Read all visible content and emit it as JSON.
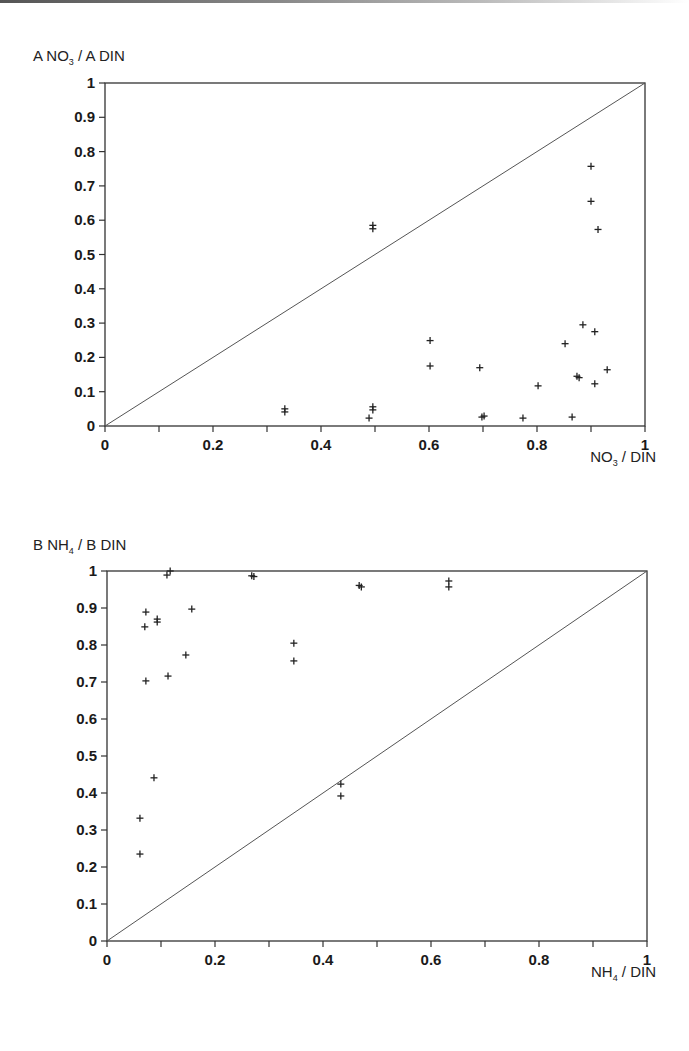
{
  "chart_data": [
    {
      "id": "A",
      "type": "scatter",
      "title": "",
      "ylabel": {
        "prefix": "A NO",
        "sub": "3",
        "suffix": " / A DIN"
      },
      "xlabel": {
        "prefix": "NO",
        "sub": "3",
        "suffix": " / DIN"
      },
      "xlim": [
        0,
        1
      ],
      "ylim": [
        0,
        1
      ],
      "x_ticks": [
        0,
        0.1,
        0.2,
        0.3,
        0.4,
        0.5,
        0.6,
        0.7,
        0.8,
        0.9,
        1
      ],
      "x_tick_labels": [
        "0",
        "",
        "0.2",
        "",
        "0.4",
        "",
        "0.6",
        "",
        "0.8",
        "",
        "1"
      ],
      "y_ticks": [
        0,
        0.1,
        0.2,
        0.3,
        0.4,
        0.5,
        0.6,
        0.7,
        0.8,
        0.9,
        1
      ],
      "y_tick_labels": [
        "0",
        "0.1",
        "0.2",
        "0.3",
        "0.4",
        "0.5",
        "0.6",
        "0.7",
        "0.8",
        "0.9",
        "1"
      ],
      "grid": false,
      "reference_line": {
        "label": "1:1 line",
        "from": [
          0,
          0
        ],
        "to": [
          1,
          1
        ]
      },
      "marker": "+",
      "points": [
        {
          "x": 0.333,
          "y": 0.05
        },
        {
          "x": 0.333,
          "y": 0.041
        },
        {
          "x": 0.489,
          "y": 0.023
        },
        {
          "x": 0.496,
          "y": 0.056
        },
        {
          "x": 0.496,
          "y": 0.047
        },
        {
          "x": 0.496,
          "y": 0.585
        },
        {
          "x": 0.496,
          "y": 0.575
        },
        {
          "x": 0.602,
          "y": 0.249
        },
        {
          "x": 0.602,
          "y": 0.175
        },
        {
          "x": 0.694,
          "y": 0.17
        },
        {
          "x": 0.698,
          "y": 0.026
        },
        {
          "x": 0.702,
          "y": 0.029
        },
        {
          "x": 0.774,
          "y": 0.023
        },
        {
          "x": 0.802,
          "y": 0.117
        },
        {
          "x": 0.852,
          "y": 0.24
        },
        {
          "x": 0.865,
          "y": 0.026
        },
        {
          "x": 0.874,
          "y": 0.145
        },
        {
          "x": 0.878,
          "y": 0.141
        },
        {
          "x": 0.885,
          "y": 0.295
        },
        {
          "x": 0.9,
          "y": 0.757
        },
        {
          "x": 0.9,
          "y": 0.655
        },
        {
          "x": 0.907,
          "y": 0.275
        },
        {
          "x": 0.907,
          "y": 0.123
        },
        {
          "x": 0.913,
          "y": 0.573
        },
        {
          "x": 0.93,
          "y": 0.164
        }
      ],
      "box": {
        "left": 105,
        "top": 83,
        "width": 540,
        "height": 343
      },
      "panel_top": 0,
      "ylabel_pos": {
        "left": 33,
        "top": 47
      },
      "xlabel_pos": {
        "right": 33,
        "top": 448
      }
    },
    {
      "id": "B",
      "type": "scatter",
      "title": "",
      "ylabel": {
        "prefix": "B NH",
        "sub": "4",
        "suffix": " / B DIN"
      },
      "xlabel": {
        "prefix": "NH",
        "sub": "4",
        "suffix": " / DIN"
      },
      "xlim": [
        0,
        1
      ],
      "ylim": [
        0,
        1
      ],
      "x_ticks": [
        0,
        0.1,
        0.2,
        0.3,
        0.4,
        0.5,
        0.6,
        0.7,
        0.8,
        0.9,
        1
      ],
      "x_tick_labels": [
        "0",
        "",
        "0.2",
        "",
        "0.4",
        "",
        "0.6",
        "",
        "0.8",
        "",
        "1"
      ],
      "y_ticks": [
        0,
        0.1,
        0.2,
        0.3,
        0.4,
        0.5,
        0.6,
        0.7,
        0.8,
        0.9,
        1
      ],
      "y_tick_labels": [
        "0",
        "0.1",
        "0.2",
        "0.3",
        "0.4",
        "0.5",
        "0.6",
        "0.7",
        "0.8",
        "0.9",
        "1"
      ],
      "grid": false,
      "reference_line": {
        "label": "1:1 line",
        "from": [
          0,
          0
        ],
        "to": [
          1,
          1
        ]
      },
      "marker": "+",
      "points": [
        {
          "x": 0.061,
          "y": 0.332
        },
        {
          "x": 0.061,
          "y": 0.235
        },
        {
          "x": 0.07,
          "y": 0.849
        },
        {
          "x": 0.072,
          "y": 0.889
        },
        {
          "x": 0.072,
          "y": 0.703
        },
        {
          "x": 0.087,
          "y": 0.441
        },
        {
          "x": 0.093,
          "y": 0.87
        },
        {
          "x": 0.093,
          "y": 0.862
        },
        {
          "x": 0.111,
          "y": 0.989
        },
        {
          "x": 0.113,
          "y": 0.716
        },
        {
          "x": 0.117,
          "y": 1.0
        },
        {
          "x": 0.146,
          "y": 0.773
        },
        {
          "x": 0.157,
          "y": 0.897
        },
        {
          "x": 0.268,
          "y": 0.987
        },
        {
          "x": 0.272,
          "y": 0.985
        },
        {
          "x": 0.346,
          "y": 0.805
        },
        {
          "x": 0.346,
          "y": 0.757
        },
        {
          "x": 0.433,
          "y": 0.424
        },
        {
          "x": 0.433,
          "y": 0.392
        },
        {
          "x": 0.467,
          "y": 0.961
        },
        {
          "x": 0.471,
          "y": 0.957
        },
        {
          "x": 0.633,
          "y": 0.973
        },
        {
          "x": 0.633,
          "y": 0.957
        }
      ],
      "box": {
        "left": 107,
        "top": 571,
        "width": 540,
        "height": 370
      },
      "panel_top": 0,
      "ylabel_pos": {
        "left": 33,
        "top": 536
      },
      "xlabel_pos": {
        "right": 33,
        "top": 963
      }
    }
  ]
}
